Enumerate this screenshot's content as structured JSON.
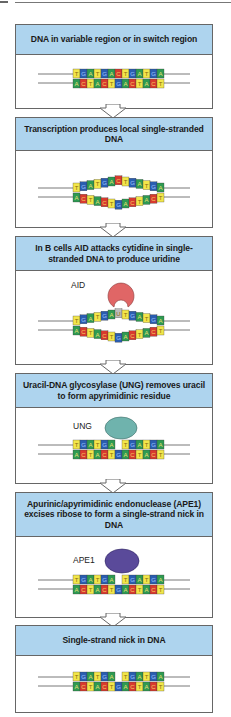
{
  "colors": {
    "T": "#f2e64a",
    "G": "#2a5db0",
    "A": "#2e9a52",
    "C": "#d83a2e",
    "U": "#bcbcbc",
    "header_bg": "#aed4ee",
    "aid": "#e06666",
    "ung": "#6fb3ad",
    "ape1": "#5a4a9a"
  },
  "sequence": {
    "top": [
      "T",
      "G",
      "A",
      "T",
      "G",
      "A",
      "C",
      "T",
      "G",
      "A",
      "T",
      "G",
      "A"
    ],
    "bottom": [
      "A",
      "C",
      "T",
      "A",
      "C",
      "T",
      "G",
      "A",
      "C",
      "T",
      "A",
      "C",
      "T"
    ]
  },
  "steps": [
    {
      "title": "DNA in variable region or in switch region",
      "state": "double"
    },
    {
      "title": "Transcription produces local single-stranded DNA",
      "state": "bubble"
    },
    {
      "title": "In B cells AID attacks cytidine in single-stranded DNA to produce uridine",
      "state": "bubble-u",
      "enzyme": "AID"
    },
    {
      "title": "Uracil-DNA glycosylase (UNG) removes uracil to form apyrimidinic residue",
      "state": "gap",
      "enzyme": "UNG"
    },
    {
      "title": "Apurinic/apyrimidinic endonuclease (APE1) excises ribose to form a single-strand nick in DNA",
      "state": "gap",
      "enzyme": "APE1"
    },
    {
      "title": "Single-strand nick in DNA",
      "state": "gap"
    }
  ]
}
